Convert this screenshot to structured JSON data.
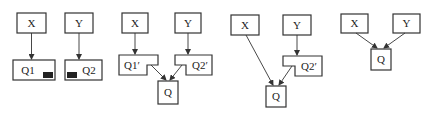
{
  "diagram": {
    "panels": [
      {
        "id": "panel-1",
        "nodes": {
          "x": "X",
          "y": "Y",
          "q1": "Q1",
          "q2": "Q2"
        }
      },
      {
        "id": "panel-2",
        "nodes": {
          "x": "X",
          "y": "Y",
          "q1": "Q1′",
          "q2": "Q2′",
          "q": "Q"
        }
      },
      {
        "id": "panel-3",
        "nodes": {
          "x": "X",
          "y": "Y",
          "q2": "Q2′",
          "q": "Q"
        }
      },
      {
        "id": "panel-4",
        "nodes": {
          "x": "X",
          "y": "Y",
          "q": "Q"
        }
      }
    ],
    "colors": {
      "stroke": "#333333",
      "fill_marker": "#222222",
      "background": "#ffffff"
    }
  }
}
